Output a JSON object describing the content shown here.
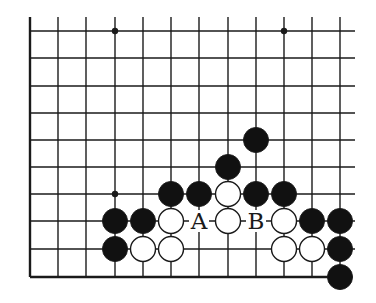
{
  "diagram": {
    "type": "go-board-fragment",
    "colors": {
      "line": "#1a1a1a",
      "black_stone": "#111111",
      "white_stone": "#ffffff",
      "background": "#ffffff"
    },
    "grid": {
      "columns_x": [
        30,
        58,
        86,
        115,
        143,
        171,
        199,
        228,
        256,
        284,
        312,
        340
      ],
      "rows_y": [
        31,
        58,
        86,
        113,
        140,
        167,
        194,
        221,
        249,
        277
      ],
      "top_extent": 17,
      "right_extent": 355,
      "left_edge_col": 0,
      "bottom_edge_row": 9
    },
    "star_points": [
      {
        "col": 3,
        "row": 0
      },
      {
        "col": 9,
        "row": 0
      },
      {
        "col": 3,
        "row": 6
      }
    ],
    "stones": [
      {
        "color": "black",
        "col": 8,
        "row": 4
      },
      {
        "color": "black",
        "col": 7,
        "row": 5
      },
      {
        "color": "black",
        "col": 5,
        "row": 6
      },
      {
        "color": "black",
        "col": 6,
        "row": 6
      },
      {
        "color": "white",
        "col": 7,
        "row": 6
      },
      {
        "color": "black",
        "col": 8,
        "row": 6
      },
      {
        "color": "black",
        "col": 9,
        "row": 6
      },
      {
        "color": "black",
        "col": 3,
        "row": 7
      },
      {
        "color": "black",
        "col": 4,
        "row": 7
      },
      {
        "color": "white",
        "col": 5,
        "row": 7
      },
      {
        "color": "white",
        "col": 7,
        "row": 7
      },
      {
        "color": "white",
        "col": 9,
        "row": 7
      },
      {
        "color": "black",
        "col": 10,
        "row": 7
      },
      {
        "color": "black",
        "col": 11,
        "row": 7
      },
      {
        "color": "black",
        "col": 3,
        "row": 8
      },
      {
        "color": "white",
        "col": 4,
        "row": 8
      },
      {
        "color": "white",
        "col": 5,
        "row": 8
      },
      {
        "color": "white",
        "col": 9,
        "row": 8
      },
      {
        "color": "white",
        "col": 10,
        "row": 8
      },
      {
        "color": "black",
        "col": 11,
        "row": 8
      },
      {
        "color": "black",
        "col": 11,
        "row": 9
      }
    ],
    "labels": [
      {
        "text": "A",
        "col": 6,
        "row": 7
      },
      {
        "text": "B",
        "col": 8,
        "row": 7
      }
    ],
    "stone_radius": 12.5
  }
}
